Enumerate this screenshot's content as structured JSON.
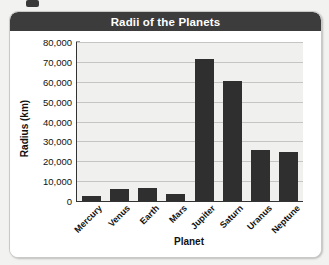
{
  "card": {
    "title": "Radii of the Planets"
  },
  "chart_data": {
    "type": "bar",
    "title": "Radii of the Planets",
    "xlabel": "Planet",
    "ylabel": "Radius (km)",
    "categories": [
      "Mercury",
      "Venus",
      "Earth",
      "Mars",
      "Jupiter",
      "Saturn",
      "Uranus",
      "Neptune"
    ],
    "values": [
      2440,
      6052,
      6378,
      3397,
      71492,
      60268,
      25559,
      24764
    ],
    "ylim": [
      0,
      80000
    ],
    "ytick_values": [
      0,
      10000,
      20000,
      30000,
      40000,
      50000,
      60000,
      70000,
      80000
    ],
    "ytick_labels": [
      "0",
      "10,000",
      "20,000",
      "30,000",
      "40,000",
      "50,000",
      "60,000",
      "70,000",
      "80,000"
    ],
    "grid": true,
    "legend": "none",
    "bar_color": "#2f2f2f",
    "plot_background": "#f0f0ee",
    "title_bar_color": "#3c3c3c"
  }
}
